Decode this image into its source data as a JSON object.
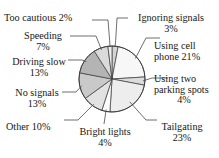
{
  "figure": {
    "cut_off_title": "",
    "background": "#ffffff",
    "width": 219,
    "height": 158
  },
  "chart_data": {
    "type": "pie",
    "title": "",
    "subtitle": "",
    "xlabel": "",
    "ylabel": "",
    "legend_position": "none",
    "grid": false,
    "units": "percent",
    "total": 100,
    "start_angle_deg": 0,
    "direction": "clockwise",
    "categories": [
      "Ignoring signals",
      "Using cell phone",
      "Using two parking spots",
      "Tailgating",
      "Bright lights",
      "Other",
      "No signals",
      "Driving slow",
      "Speeding",
      "Too cautious"
    ],
    "values": [
      3,
      21,
      4,
      23,
      4,
      10,
      13,
      13,
      7,
      2
    ],
    "slices": [
      {
        "label": "Ignoring signals",
        "value": 3,
        "value_text": "3%",
        "label_text": "Ignoring signals 3%",
        "fill": "#d4d4d4",
        "start_deg": 0,
        "end_deg": 10.8
      },
      {
        "label": "Using cell phone",
        "value": 21,
        "value_text": "21%",
        "label_text": "Using cell phone 21%",
        "fill": "#f7f7f7",
        "start_deg": 10.8,
        "end_deg": 86.4
      },
      {
        "label": "Using two parking spots",
        "value": 4,
        "value_text": "4%",
        "label_text": "Using two parking spots 4%",
        "fill": "#dcdcdc",
        "start_deg": 86.4,
        "end_deg": 100.8
      },
      {
        "label": "Tailgating",
        "value": 23,
        "value_text": "23%",
        "label_text": "Tailgating 23%",
        "fill": "#ededed",
        "start_deg": 100.8,
        "end_deg": 183.6
      },
      {
        "label": "Bright lights",
        "value": 4,
        "value_text": "4%",
        "label_text": "Bright lights 4%",
        "fill": "#fbfbfb",
        "start_deg": 183.6,
        "end_deg": 198.0
      },
      {
        "label": "Other",
        "value": 10,
        "value_text": "10%",
        "label_text": "Other 10%",
        "fill": "#e2e2e2",
        "start_deg": 198.0,
        "end_deg": 234.0
      },
      {
        "label": "No signals",
        "value": 13,
        "value_text": "13%",
        "label_text": "No signals 13%",
        "fill": "#c9c9c9",
        "start_deg": 234.0,
        "end_deg": 280.8
      },
      {
        "label": "Driving slow",
        "value": 13,
        "value_text": "13%",
        "label_text": "Driving slow 13%",
        "fill": "#b4b4b4",
        "start_deg": 280.8,
        "end_deg": 327.6
      },
      {
        "label": "Speeding",
        "value": 7,
        "value_text": "7%",
        "label_text": "Speeding 7%",
        "fill": "#dadada",
        "start_deg": 327.6,
        "end_deg": 352.8
      },
      {
        "label": "Too cautious",
        "value": 2,
        "value_text": "2%",
        "label_text": "Too cautious 2%",
        "fill": "#efefef",
        "start_deg": 352.8,
        "end_deg": 360.0
      }
    ]
  },
  "labels": {
    "too_cautious": {
      "line1": "Too cautious 2%"
    },
    "speeding": {
      "line1": "Speeding",
      "line2": "7%"
    },
    "driving_slow": {
      "line1": "Driving slow",
      "line2": "13%"
    },
    "no_signals": {
      "line1": "No signals",
      "line2": "13%"
    },
    "other": {
      "line1": "Other 10%"
    },
    "bright_lights": {
      "line1": "Bright lights",
      "line2": "4%"
    },
    "tailgating": {
      "line1": "Tailgating",
      "line2": "23%"
    },
    "using_two_parking_spots": {
      "line1": "Using two",
      "line2": "parking spots",
      "line3": "4%"
    },
    "using_cell_phone": {
      "line1": "Using cell",
      "line2": "phone 21%"
    },
    "ignoring_signals": {
      "line1": "Ignoring signals",
      "line2": "3%"
    }
  },
  "style": {
    "slice_outline": "#3a3a3a",
    "leader_line": "#4a4a4a",
    "text_color": "#171717"
  }
}
